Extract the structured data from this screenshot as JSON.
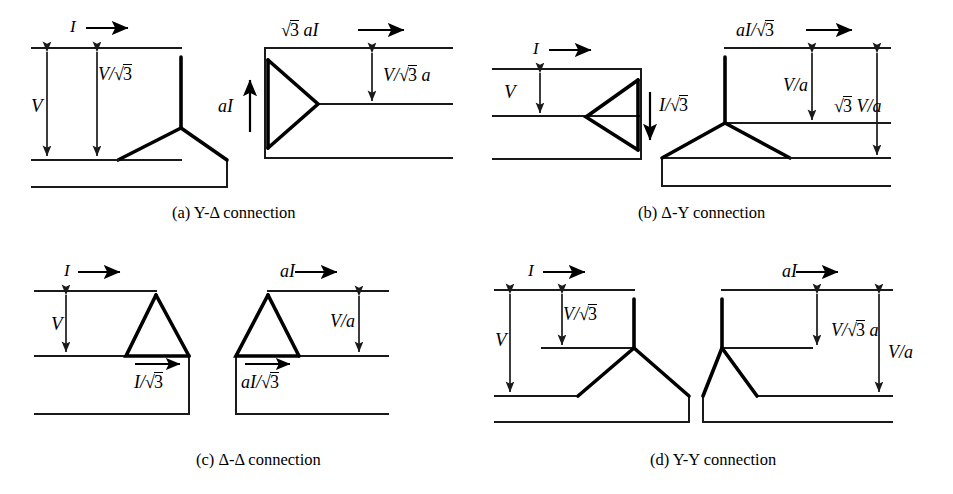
{
  "figure": {
    "background_color": "#ffffff",
    "line_color": "#1a1a1a",
    "winding_color": "#000000"
  },
  "panels": [
    {
      "id": "a",
      "caption": "(a) Y-Δ connection",
      "primary": {
        "type": "wye",
        "side": "left"
      },
      "secondary": {
        "type": "delta",
        "side": "right"
      },
      "labels": {
        "primary_current": "I",
        "primary_voltage_line": "V",
        "primary_voltage_phase_num": "V/",
        "primary_voltage_phase_root": "3",
        "secondary_current": "3 aI",
        "secondary_current_prefix_root": "3",
        "secondary_current_rest": "aI",
        "secondary_phase_current": "aI",
        "secondary_voltage_num": "V/",
        "secondary_voltage_root": "3",
        "secondary_voltage_suffix": "a"
      }
    },
    {
      "id": "b",
      "caption": "(b) Δ-Y connection",
      "primary": {
        "type": "delta",
        "side": "left"
      },
      "secondary": {
        "type": "wye",
        "side": "right"
      },
      "labels": {
        "primary_current": "I",
        "primary_voltage": "V",
        "primary_phase_current_num": "I/",
        "primary_phase_current_root": "3",
        "secondary_current_num": "aI/",
        "secondary_current_root": "3",
        "secondary_voltage_phase": "V/a",
        "secondary_voltage_line_root": "3",
        "secondary_voltage_line_rest": "V/a"
      }
    },
    {
      "id": "c",
      "caption": "(c) Δ-Δ connection",
      "primary": {
        "type": "delta",
        "side": "left"
      },
      "secondary": {
        "type": "delta",
        "side": "right"
      },
      "labels": {
        "primary_current": "I",
        "primary_voltage": "V",
        "primary_phase_current_num": "I/",
        "primary_phase_current_root": "3",
        "secondary_current": "aI",
        "secondary_voltage": "V/a",
        "secondary_phase_current_num": "aI/",
        "secondary_phase_current_root": "3"
      }
    },
    {
      "id": "d",
      "caption": "(d) Y-Y connection",
      "primary": {
        "type": "wye",
        "side": "left"
      },
      "secondary": {
        "type": "wye",
        "side": "right"
      },
      "labels": {
        "primary_current": "I",
        "primary_voltage_line": "V",
        "primary_voltage_phase_num": "V/",
        "primary_voltage_phase_root": "3",
        "secondary_current": "aI",
        "secondary_voltage_phase_num": "V/",
        "secondary_voltage_phase_root": "3",
        "secondary_voltage_phase_suffix": "a",
        "secondary_voltage_line": "V/a"
      }
    }
  ],
  "captions": {
    "a": "(a) Y-Δ connection",
    "b": "(b) Δ-Y connection",
    "c": "(c) Δ-Δ connection",
    "d": "(d) Y-Y connection"
  }
}
